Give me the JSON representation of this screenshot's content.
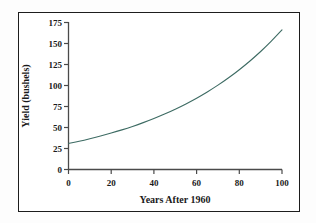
{
  "figure": {
    "background_color": "#fdfdfd",
    "panel_color": "#ffffff",
    "border_color": "#1d1d1d"
  },
  "chart_data": {
    "type": "line",
    "title": "",
    "subtitle": "",
    "xlabel": "Years After 1960",
    "ylabel": "Yield (bushels)",
    "xlim": [
      0,
      100
    ],
    "ylim": [
      0,
      175
    ],
    "xticks": [
      0,
      20,
      40,
      60,
      80,
      100
    ],
    "xtick_labels": [
      "0",
      "20",
      "40",
      "60",
      "80",
      "100"
    ],
    "yticks": [
      0,
      25,
      50,
      75,
      100,
      125,
      150,
      175
    ],
    "ytick_labels": [
      "0",
      "25",
      "50",
      "75",
      "100",
      "125",
      "150",
      "175"
    ],
    "grid": false,
    "legend": false,
    "legend_position": "none",
    "series": [
      {
        "name": "Corn yield",
        "color": "#3d6b63",
        "line_width": 1.1,
        "x": [
          0,
          5,
          10,
          15,
          20,
          25,
          30,
          35,
          40,
          45,
          50,
          55,
          60,
          65,
          70,
          75,
          80,
          85,
          90,
          95,
          100
        ],
        "y": [
          31.0,
          33.7,
          36.7,
          39.9,
          43.4,
          47.2,
          51.3,
          55.8,
          60.7,
          66.0,
          71.8,
          78.1,
          84.9,
          92.3,
          100.4,
          109.2,
          118.8,
          129.2,
          140.5,
          152.8,
          166.2
        ]
      }
    ],
    "annotations": []
  }
}
